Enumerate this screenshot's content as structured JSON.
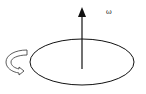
{
  "diagram": {
    "axis_label": "ω",
    "colors": {
      "stroke": "#111111",
      "background": "#ffffff",
      "arrow_fill": "#ffffff"
    },
    "elements": [
      {
        "type": "ellipse",
        "name": "rotating-disk"
      },
      {
        "type": "arrow",
        "name": "angular-velocity-vector",
        "direction": "up"
      },
      {
        "type": "curved-arrow",
        "name": "rotation-direction",
        "sense": "counterclockwise"
      }
    ]
  }
}
